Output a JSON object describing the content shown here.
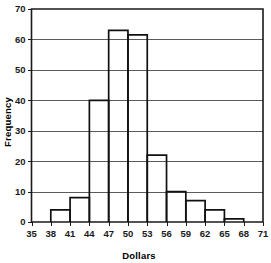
{
  "chart_data": {
    "type": "bar",
    "title": "",
    "subtitle": "",
    "xlabel": "Dollars",
    "ylabel": "Frequency",
    "categories": [
      "35-38",
      "38-41",
      "41-44",
      "44-47",
      "47-50",
      "50-53",
      "53-56",
      "56-59",
      "59-62",
      "62-65",
      "65-68",
      "68-71"
    ],
    "bin_edges": [
      35,
      38,
      41,
      44,
      47,
      50,
      53,
      56,
      59,
      62,
      65,
      68,
      71
    ],
    "values": [
      0,
      4,
      8,
      40,
      63,
      61.5,
      22,
      10,
      7,
      4,
      1,
      0
    ],
    "bin_width": 3,
    "xlim": [
      35,
      71
    ],
    "ylim": [
      0,
      70
    ],
    "xticks": [
      35,
      38,
      41,
      44,
      47,
      50,
      53,
      56,
      59,
      62,
      65,
      68,
      71
    ],
    "yticks": [
      0,
      10,
      20,
      30,
      40,
      50,
      60,
      70
    ],
    "xtick_labels": [
      "35",
      "38",
      "41",
      "44",
      "47",
      "50",
      "53",
      "56",
      "59",
      "62",
      "65",
      "68",
      "71"
    ],
    "ytick_labels": [
      "0",
      "10",
      "20",
      "30",
      "40",
      "50",
      "60",
      "70"
    ],
    "grid": "horizontal",
    "legend": null,
    "legend_position": "none",
    "annotations": [],
    "colors": {
      "bar_fill": "#ffffff",
      "bar_stroke": "#111111",
      "grid": "#5b5b5b",
      "frame": "#1a1a1a",
      "text": "#000000",
      "background": "#ffffff"
    }
  }
}
